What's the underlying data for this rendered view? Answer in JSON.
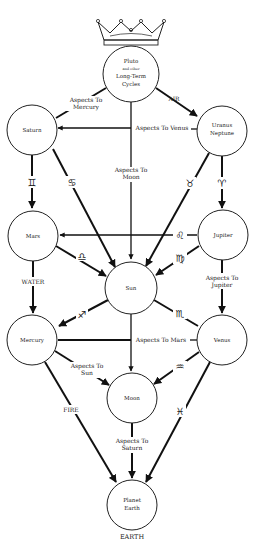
{
  "diagram": {
    "type": "tree-of-life astrological chart",
    "nodes": {
      "pluto": {
        "line1": "Pluto",
        "line2": "and other",
        "line3": "Long-Term",
        "line4": "Cycles"
      },
      "saturn": {
        "label": "Saturn"
      },
      "uranus": {
        "line1": "Uranus",
        "line2": "Neptune"
      },
      "mars": {
        "label": "Mars"
      },
      "jupiter": {
        "label": "Jupiter"
      },
      "sun": {
        "label": "Sun"
      },
      "mercury": {
        "label": "Mercury"
      },
      "venus": {
        "label": "Venus"
      },
      "moon": {
        "label": "Moon"
      },
      "earth": {
        "line1": "Planet",
        "line2": "Earth"
      }
    },
    "edge_labels": {
      "aspects_mercury_1": "Aspects To",
      "aspects_mercury_2": "Mercury",
      "air": "AIR",
      "aspects_venus": "Aspects To Venus",
      "aspects_moon_1": "Aspects To",
      "aspects_moon_2": "Moon",
      "water": "WATER",
      "aspects_jupiter_1": "Aspects To",
      "aspects_jupiter_2": "Jupiter",
      "aspects_mars": "Aspects To Mars",
      "aspects_sun_1": "Aspects To",
      "aspects_sun_2": "Sun",
      "fire": "FIRE",
      "aspects_saturn_1": "Aspects To",
      "aspects_saturn_2": "Saturn",
      "earth_element": "EARTH"
    },
    "zodiac_symbols": {
      "gemini": "♊",
      "cancer": "♋",
      "leo": "♌",
      "aries": "♈",
      "libra": "♎",
      "virgo": "♍",
      "sagittarius": "♐",
      "scorpio": "♏",
      "aquarius": "♒",
      "pisces": "♓",
      "taurus": "♉"
    },
    "icons": {
      "crown": "crown-icon"
    }
  }
}
